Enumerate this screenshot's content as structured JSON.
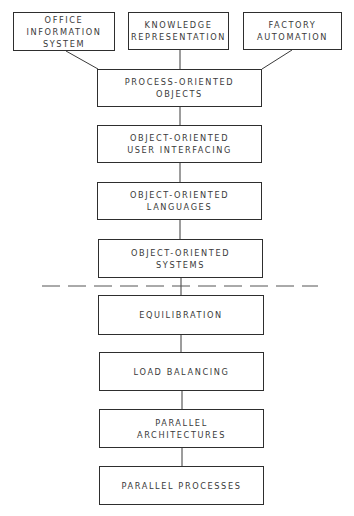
{
  "diagram": {
    "top_nodes": [
      {
        "id": "office",
        "label": "OFFICE\nINFORMATION\nSYSTEM"
      },
      {
        "id": "knowledge",
        "label": "KNOWLEDGE\nREPRESENTATION"
      },
      {
        "id": "factory",
        "label": "FACTORY\nAUTOMATION"
      }
    ],
    "upper_stack": [
      {
        "id": "process",
        "label": "PROCESS-ORIENTED\nOBJECTS"
      },
      {
        "id": "ui",
        "label": "OBJECT-ORIENTED\nUSER INTERFACING"
      },
      {
        "id": "languages",
        "label": "OBJECT-ORIENTED\nLANGUAGES"
      },
      {
        "id": "systems",
        "label": "OBJECT-ORIENTED\nSYSTEMS"
      }
    ],
    "lower_stack": [
      {
        "id": "equilibration",
        "label": "EQUILIBRATION"
      },
      {
        "id": "load",
        "label": "LOAD BALANCING"
      },
      {
        "id": "architectures",
        "label": "PARALLEL\nARCHITECTURES"
      },
      {
        "id": "processes",
        "label": "PARALLEL PROCESSES"
      }
    ],
    "edges": [
      [
        "office",
        "process"
      ],
      [
        "knowledge",
        "process"
      ],
      [
        "factory",
        "process"
      ],
      [
        "process",
        "ui"
      ],
      [
        "ui",
        "languages"
      ],
      [
        "languages",
        "systems"
      ],
      [
        "systems",
        "equilibration"
      ],
      [
        "equilibration",
        "load"
      ],
      [
        "load",
        "architectures"
      ],
      [
        "architectures",
        "processes"
      ]
    ],
    "separator": "dashed"
  }
}
